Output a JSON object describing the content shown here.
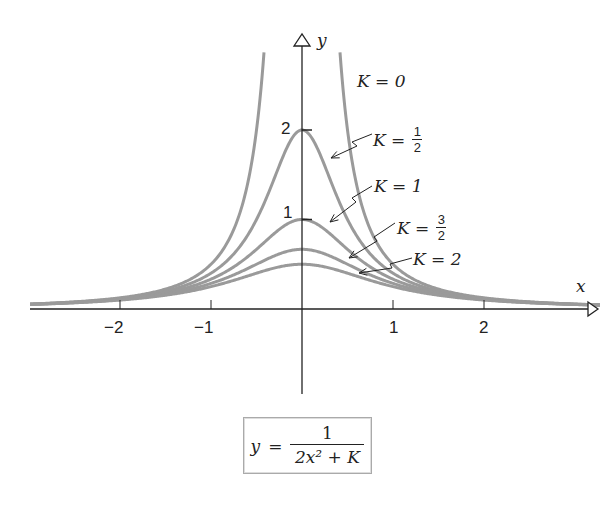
{
  "chart_data": {
    "type": "line",
    "title": "",
    "formula": {
      "lhs": "y",
      "equals": "=",
      "numerator": "1",
      "denominator": "2x² + K"
    },
    "xlabel": "x",
    "ylabel": "y",
    "xlim": [
      -3.0,
      3.0
    ],
    "ylim": [
      -1.0,
      3.0
    ],
    "grid": false,
    "x_ticks": [
      -2,
      -1,
      1,
      2
    ],
    "x_tick_labels": [
      "−2",
      "−1",
      "1",
      "2"
    ],
    "y_ticks": [
      1,
      2
    ],
    "y_tick_labels": [
      "1",
      "2"
    ],
    "series": [
      {
        "name": "K = 0",
        "K": 0,
        "label_text": "K = 0"
      },
      {
        "name": "K = 1/2",
        "K": 0.5,
        "label_text": "K =",
        "label_frac": [
          "1",
          "2"
        ],
        "peak": 2
      },
      {
        "name": "K = 1",
        "K": 1,
        "label_text": "K = 1",
        "peak": 1
      },
      {
        "name": "K = 3/2",
        "K": 1.5,
        "label_text": "K =",
        "label_frac": [
          "3",
          "2"
        ],
        "peak": 0.667
      },
      {
        "name": "K = 2",
        "K": 2,
        "label_text": "K = 2",
        "peak": 0.5
      }
    ],
    "curve_color": "#9a9a9a",
    "axis_color": "#222222"
  }
}
